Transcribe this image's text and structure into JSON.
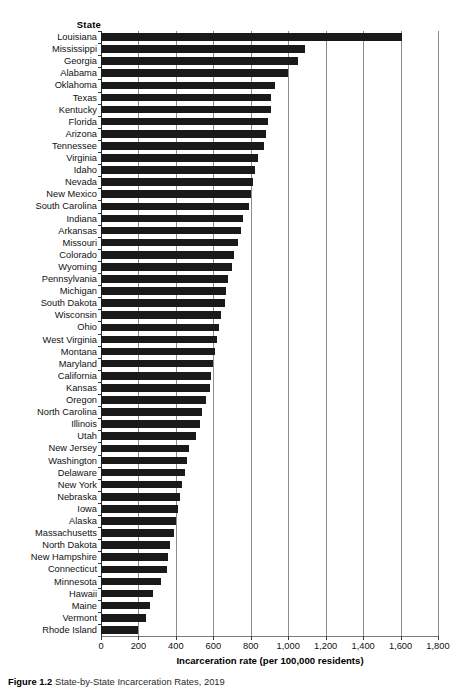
{
  "chart_data": {
    "type": "bar",
    "orientation": "horizontal",
    "title": "",
    "xlabel": "Incarceration rate (per 100,000 residents)",
    "ylabel": "State",
    "xlim": [
      0,
      1800
    ],
    "xticks": [
      0,
      200,
      400,
      600,
      800,
      1000,
      1200,
      1400,
      1600,
      1800
    ],
    "xtick_labels": [
      "0",
      "200",
      "400",
      "600",
      "800",
      "1,000",
      "1,200",
      "1,400",
      "1,600",
      "1,800"
    ],
    "grid": "vertical",
    "legend": "none",
    "bar_color": "#1a1a1a",
    "categories": [
      "Louisiana",
      "Mississippi",
      "Georgia",
      "Alabama",
      "Oklahoma",
      "Texas",
      "Kentucky",
      "Florida",
      "Arizona",
      "Tennessee",
      "Virginia",
      "Idaho",
      "Nevada",
      "New Mexico",
      "South Carolina",
      "Indiana",
      "Arkansas",
      "Missouri",
      "Colorado",
      "Wyoming",
      "Pennsylvania",
      "Michigan",
      "South Dakota",
      "Wisconsin",
      "Ohio",
      "West Virginia",
      "Montana",
      "Maryland",
      "California",
      "Kansas",
      "Oregon",
      "North Carolina",
      "Illinois",
      "Utah",
      "New Jersey",
      "Washington",
      "Delaware",
      "New York",
      "Nebraska",
      "Iowa",
      "Alaska",
      "Massachusetts",
      "North Dakota",
      "New Hampshire",
      "Connecticut",
      "Minnesota",
      "Hawaii",
      "Maine",
      "Vermont",
      "Rhode Island"
    ],
    "values": [
      1610,
      1090,
      1050,
      1000,
      930,
      910,
      910,
      890,
      880,
      870,
      840,
      820,
      810,
      800,
      790,
      760,
      750,
      730,
      710,
      700,
      680,
      670,
      660,
      640,
      630,
      620,
      610,
      600,
      590,
      580,
      560,
      540,
      530,
      510,
      470,
      460,
      450,
      430,
      420,
      410,
      400,
      390,
      370,
      360,
      350,
      320,
      280,
      260,
      240,
      195
    ],
    "caption": "Figure 1.2  State-by-State Incarceration Rates, 2019"
  },
  "header": {
    "state_column": "State"
  }
}
